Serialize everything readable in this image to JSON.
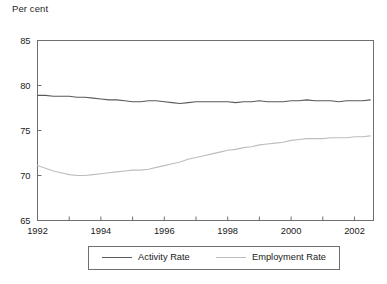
{
  "chart_data": {
    "type": "line",
    "title": "",
    "ylabel": "Per cent",
    "xlabel": "",
    "ylim": [
      65,
      85
    ],
    "xlim": [
      1992.0,
      2002.6
    ],
    "yticks": [
      65,
      70,
      75,
      80,
      85
    ],
    "ytick_labels": [
      "65",
      "70",
      "75",
      "80",
      "85"
    ],
    "xticks": [
      1992,
      1993,
      1994,
      1995,
      1996,
      1997,
      1998,
      1999,
      2000,
      2001,
      2002
    ],
    "xtick_labels": [
      "1992",
      "",
      "1994",
      "",
      "1996",
      "",
      "1998",
      "",
      "2000",
      "",
      "2002"
    ],
    "xtick_labels_shown": [
      "1992",
      "1994",
      "1996",
      "1998",
      "2000",
      "2002"
    ],
    "grid": false,
    "legend_position": "below-plot",
    "series": [
      {
        "name": "Activity Rate",
        "color": "#5a5a5a",
        "x": [
          1992.0,
          1992.25,
          1992.5,
          1992.75,
          1993.0,
          1993.25,
          1993.5,
          1993.75,
          1994.0,
          1994.25,
          1994.5,
          1994.75,
          1995.0,
          1995.25,
          1995.5,
          1995.75,
          1996.0,
          1996.25,
          1996.5,
          1996.75,
          1997.0,
          1997.25,
          1997.5,
          1997.75,
          1998.0,
          1998.25,
          1998.5,
          1998.75,
          1999.0,
          1999.25,
          1999.5,
          1999.75,
          2000.0,
          2000.25,
          2000.5,
          2000.75,
          2001.0,
          2001.25,
          2001.5,
          2001.75,
          2002.0,
          2002.25,
          2002.5
        ],
        "values": [
          78.9,
          78.9,
          78.8,
          78.8,
          78.8,
          78.7,
          78.7,
          78.6,
          78.5,
          78.4,
          78.4,
          78.3,
          78.2,
          78.2,
          78.3,
          78.3,
          78.2,
          78.1,
          78.0,
          78.1,
          78.2,
          78.2,
          78.2,
          78.2,
          78.2,
          78.1,
          78.2,
          78.2,
          78.3,
          78.2,
          78.2,
          78.2,
          78.3,
          78.3,
          78.4,
          78.3,
          78.3,
          78.3,
          78.2,
          78.3,
          78.3,
          78.3,
          78.4
        ]
      },
      {
        "name": "Employment Rate",
        "color": "#bdbdbd",
        "x": [
          1992.0,
          1992.25,
          1992.5,
          1992.75,
          1993.0,
          1993.25,
          1993.5,
          1993.75,
          1994.0,
          1994.25,
          1994.5,
          1994.75,
          1995.0,
          1995.25,
          1995.5,
          1995.75,
          1996.0,
          1996.25,
          1996.5,
          1996.75,
          1997.0,
          1997.25,
          1997.5,
          1997.75,
          1998.0,
          1998.25,
          1998.5,
          1998.75,
          1999.0,
          1999.25,
          1999.5,
          1999.75,
          2000.0,
          2000.25,
          2000.5,
          2000.75,
          2001.0,
          2001.25,
          2001.5,
          2001.75,
          2002.0,
          2002.25,
          2002.5
        ],
        "values": [
          71.1,
          70.8,
          70.5,
          70.3,
          70.1,
          70.0,
          70.0,
          70.1,
          70.2,
          70.3,
          70.4,
          70.5,
          70.6,
          70.6,
          70.7,
          70.9,
          71.1,
          71.3,
          71.5,
          71.8,
          72.0,
          72.2,
          72.4,
          72.6,
          72.8,
          72.9,
          73.1,
          73.2,
          73.4,
          73.5,
          73.6,
          73.7,
          73.9,
          74.0,
          74.1,
          74.1,
          74.1,
          74.2,
          74.2,
          74.2,
          74.3,
          74.3,
          74.4
        ]
      }
    ]
  },
  "legend": {
    "entries": [
      {
        "label": "Activity Rate",
        "color": "#5a5a5a"
      },
      {
        "label": "Employment Rate",
        "color": "#bdbdbd"
      }
    ]
  },
  "colors": {
    "axis": "#6f6f6f",
    "text": "#1a1a1a",
    "background": "#ffffff",
    "activity_rate": "#5a5a5a",
    "employment_rate": "#bdbdbd"
  }
}
